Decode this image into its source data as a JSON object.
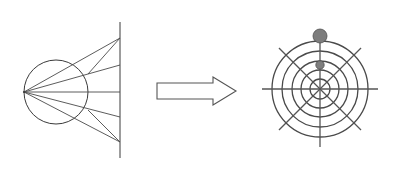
{
  "figure": {
    "background_color": "#ffffff",
    "width": 402,
    "height": 179
  },
  "left_panel": {
    "name": "point-source-ray-diagram",
    "stroke_color": "#3a3a3a",
    "circle": {
      "cx": 56,
      "cy": 92,
      "r": 32
    },
    "source_point": {
      "x": 24,
      "y": 92
    },
    "screen_line": {
      "x": 120,
      "y_top": 22,
      "y_bottom": 158
    },
    "rays": [
      {
        "label": "ray-1",
        "end_x": 120,
        "end_y": 38
      },
      {
        "label": "ray-2",
        "end_x": 120,
        "end_y": 65
      },
      {
        "label": "ray-3",
        "end_x": 120,
        "end_y": 92
      },
      {
        "label": "ray-4",
        "end_x": 120,
        "end_y": 117
      },
      {
        "label": "ray-5",
        "end_x": 120,
        "end_y": 142
      }
    ]
  },
  "arrow": {
    "name": "transform-arrow",
    "direction": "right",
    "fill_color": "#ffffff",
    "stroke_color": "#555555",
    "shaft": {
      "x": 157,
      "y": 83,
      "width": 56,
      "height": 16
    },
    "head": {
      "tip_x": 236,
      "half_height": 14
    }
  },
  "right_panel": {
    "name": "polar-radiation-pattern",
    "center": {
      "x": 320,
      "y": 89
    },
    "stroke_color": "#4a4a4a",
    "ring_count": 5,
    "ring_radii": [
      10,
      19,
      28,
      38,
      48
    ],
    "axis_extent": 58,
    "axes": [
      {
        "label": "horizontal-axis",
        "angle_deg": 0
      },
      {
        "label": "diagonal-axis-45",
        "angle_deg": 45
      },
      {
        "label": "vertical-axis",
        "angle_deg": 90
      },
      {
        "label": "diagonal-axis-135",
        "angle_deg": 135
      }
    ],
    "markers": [
      {
        "label": "outer-marker",
        "x": 320,
        "y": 36,
        "r": 7,
        "color": "#7d7d7d"
      },
      {
        "label": "inner-marker",
        "x": 320,
        "y": 65,
        "r": 4.2,
        "color": "#7d7d7d"
      }
    ]
  }
}
